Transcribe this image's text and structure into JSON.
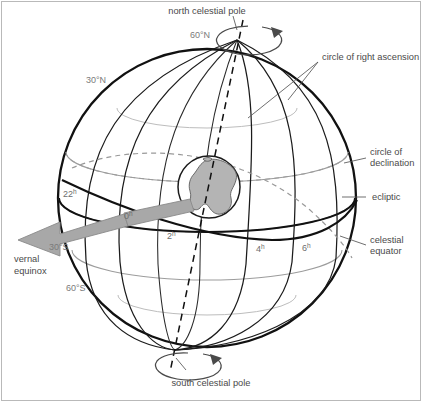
{
  "figure": {
    "background": "#ffffff",
    "border_color": "#b9b9b9"
  },
  "labels": {
    "north_celestial_pole": "north celestial pole",
    "south_celestial_pole": "south celestial pole",
    "circle_of_right_ascension": "circle of right ascension",
    "circle_of_declination_line1": "circle of",
    "circle_of_declination_line2": "declination",
    "ecliptic": "ecliptic",
    "celestial_equator_line1": "celestial",
    "celestial_equator_line2": "equator",
    "vernal_equinox_line1": "vernal",
    "vernal_equinox_line2": "equinox"
  },
  "declination_labels": [
    {
      "text": "60",
      "sup": "°N",
      "x": 92,
      "y": 80
    },
    {
      "text": "30",
      "sup": "°N",
      "x": 92,
      "y": 80
    },
    {
      "text": "30",
      "sup": "°S",
      "x": 48,
      "y": 248
    },
    {
      "text": "60",
      "sup": "°S",
      "x": 68,
      "y": 290
    }
  ],
  "grid_text": {
    "n60": "60°N",
    "n30": "30°N",
    "s30": "30°S",
    "s60": "60°S"
  },
  "hour_labels": [
    {
      "num": "22",
      "sup": "h"
    },
    {
      "num": "0",
      "sup": "h"
    },
    {
      "num": "2",
      "sup": "h"
    },
    {
      "num": "4",
      "sup": "h"
    },
    {
      "num": "6",
      "sup": "h"
    }
  ],
  "colors": {
    "outline": "#111111",
    "meridian": "#1b1b1b",
    "parallel": "#9c9c9c",
    "ecliptic": "#111111",
    "arrow_fill": "#a8a8a8",
    "earth_land": "#b4b4b4",
    "text": "#4a4a4a"
  },
  "elements": {
    "earth_name": "earth-globe",
    "axis_name": "rotation-axis",
    "rotation_arrow_north": "rotation-direction-arrow-north",
    "rotation_arrow_south": "rotation-direction-arrow-south"
  }
}
